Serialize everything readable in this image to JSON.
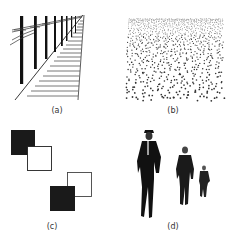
{
  "figure": {
    "panels": [
      {
        "id": "a",
        "label": "(a)",
        "depicts": "railway tracks with telephone poles receding in perspective"
      },
      {
        "id": "b",
        "label": "(b)",
        "depicts": "texture gradient of dots, dense at top and sparse at bottom"
      },
      {
        "id": "c",
        "label": "(c)",
        "depicts": "overlapping black and white squares showing interposition"
      },
      {
        "id": "d",
        "label": "(d)",
        "depicts": "three men walking, decreasing in size with distance"
      }
    ]
  }
}
